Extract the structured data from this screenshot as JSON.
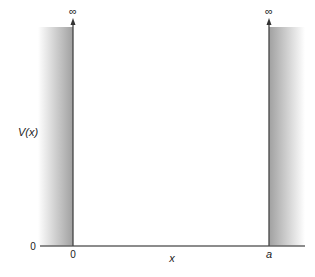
{
  "diagram": {
    "type": "infinite-square-well potential",
    "y_axis_label": "V(x)",
    "x_axis_label": "x",
    "y_origin_label": "0",
    "left_wall_label": "0",
    "right_wall_label": "a",
    "left_wall_top_label": "∞",
    "right_wall_top_label": "∞",
    "colors": {
      "wall_shade_dark": "#9a9a9a",
      "wall_shade_light": "#ffffff",
      "axis_line": "#555555",
      "text": "#222222"
    }
  }
}
